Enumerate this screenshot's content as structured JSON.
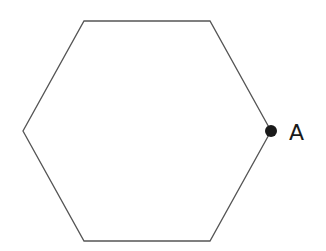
{
  "diagram": {
    "shape": "regular-hexagon",
    "stroke_color": "#555555",
    "fill_color": "#ffffff",
    "vertices": [
      [
        84,
        21
      ],
      [
        210,
        21
      ],
      [
        271,
        131
      ],
      [
        210,
        241
      ],
      [
        84,
        241
      ],
      [
        23,
        131
      ]
    ],
    "point": {
      "label": "A",
      "x": 271,
      "y": 131,
      "color": "#1a1a1a"
    }
  }
}
